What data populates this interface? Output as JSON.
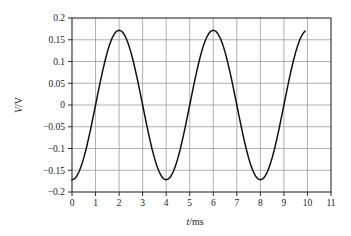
{
  "chart_data": {
    "type": "line",
    "title": "",
    "subtitle": "",
    "xlabel": "t/ms",
    "xlabel_variable": "t",
    "xlabel_unit": "/ms",
    "ylabel": "V/V",
    "ylabel_variable": "V",
    "ylabel_unit": "/V",
    "xlim": [
      0,
      11
    ],
    "ylim": [
      -0.2,
      0.2
    ],
    "xticks": [
      0,
      1,
      2,
      3,
      4,
      5,
      6,
      7,
      8,
      9,
      10,
      11
    ],
    "xtick_labels": [
      "0",
      "1",
      "2",
      "3",
      "4",
      "5",
      "6",
      "7",
      "8",
      "9",
      "10",
      "11"
    ],
    "yticks": [
      0.2,
      0.15,
      0.1,
      0.05,
      0,
      -0.05,
      -0.1,
      -0.15,
      -0.2
    ],
    "ytick_labels": [
      "0.2",
      "0.15",
      "0.1",
      "0.05",
      "0",
      "−0.05",
      "−0.1",
      "−0.15",
      "−0.2"
    ],
    "grid": true,
    "grid_x": true,
    "grid_y": true,
    "legend": false,
    "legend_position": "none",
    "waveform": {
      "shape": "sinusoid",
      "amplitude": 0.172,
      "period_ms": 4.0,
      "frequency_hz": 250,
      "offset": 0,
      "phase_description": "starts at minimum at t = 0",
      "data_start_ms": 0,
      "data_end_ms": 9.9
    },
    "annotations": [],
    "features": [
      {
        "label": "start",
        "t_ms": 0,
        "v": -0.172
      },
      {
        "label": "zero-crossing-rising",
        "t_ms": 1.0,
        "v": 0
      },
      {
        "label": "peak-1",
        "t_ms": 1.95,
        "v": 0.172
      },
      {
        "label": "zero-crossing-falling",
        "t_ms": 3.0,
        "v": 0
      },
      {
        "label": "trough-1",
        "t_ms": 4.0,
        "v": -0.172
      },
      {
        "label": "zero-crossing-rising",
        "t_ms": 5.0,
        "v": 0
      },
      {
        "label": "peak-2",
        "t_ms": 5.95,
        "v": 0.172
      },
      {
        "label": "zero-crossing-falling",
        "t_ms": 7.0,
        "v": 0
      },
      {
        "label": "trough-2",
        "t_ms": 8.0,
        "v": -0.172
      },
      {
        "label": "zero-crossing-rising",
        "t_ms": 9.0,
        "v": 0
      },
      {
        "label": "end",
        "t_ms": 9.9,
        "v": 0.171
      }
    ],
    "x": [
      0,
      0.1,
      0.2,
      0.3,
      0.4,
      0.5,
      0.6,
      0.7,
      0.8,
      0.9,
      1.0,
      1.1,
      1.2,
      1.3,
      1.4,
      1.5,
      1.6,
      1.7,
      1.8,
      1.9,
      2.0,
      2.1,
      2.2,
      2.3,
      2.4,
      2.5,
      2.6,
      2.7,
      2.8,
      2.9,
      3.0,
      3.1,
      3.2,
      3.3,
      3.4,
      3.5,
      3.6,
      3.7,
      3.8,
      3.9,
      4.0,
      4.1,
      4.2,
      4.3,
      4.4,
      4.5,
      4.6,
      4.7,
      4.8,
      4.9,
      5.0,
      5.1,
      5.2,
      5.3,
      5.4,
      5.5,
      5.6,
      5.7,
      5.8,
      5.9,
      6.0,
      6.1,
      6.2,
      6.3,
      6.4,
      6.5,
      6.6,
      6.7,
      6.8,
      6.9,
      7.0,
      7.1,
      7.2,
      7.3,
      7.4,
      7.5,
      7.6,
      7.7,
      7.8,
      7.9,
      8.0,
      8.1,
      8.2,
      8.3,
      8.4,
      8.5,
      8.6,
      8.7,
      8.8,
      8.9,
      9.0,
      9.1,
      9.2,
      9.3,
      9.4,
      9.5,
      9.6,
      9.7,
      9.8,
      9.9
    ],
    "y": [
      -0.172,
      -0.1699,
      -0.1637,
      -0.1535,
      -0.1393,
      -0.1216,
      -0.1011,
      -0.0779,
      -0.0531,
      -0.0269,
      0.0,
      0.0269,
      0.0531,
      0.0779,
      0.1011,
      0.1216,
      0.1393,
      0.1535,
      0.1637,
      0.1699,
      0.172,
      0.1699,
      0.1637,
      0.1535,
      0.1393,
      0.1216,
      0.1011,
      0.0779,
      0.0531,
      0.0269,
      0.0,
      -0.0269,
      -0.0531,
      -0.0779,
      -0.1011,
      -0.1216,
      -0.1393,
      -0.1535,
      -0.1637,
      -0.1699,
      -0.172,
      -0.1699,
      -0.1637,
      -0.1535,
      -0.1393,
      -0.1216,
      -0.1011,
      -0.0779,
      -0.0531,
      -0.0269,
      0.0,
      0.0269,
      0.0531,
      0.0779,
      0.1011,
      0.1216,
      0.1393,
      0.1535,
      0.1637,
      0.1699,
      0.172,
      0.1699,
      0.1637,
      0.1535,
      0.1393,
      0.1216,
      0.1011,
      0.0779,
      0.0531,
      0.0269,
      0.0,
      -0.0269,
      -0.0531,
      -0.0779,
      -0.1011,
      -0.1216,
      -0.1393,
      -0.1535,
      -0.1637,
      -0.1699,
      -0.172,
      -0.1699,
      -0.1637,
      -0.1535,
      -0.1393,
      -0.1216,
      -0.1011,
      -0.0779,
      -0.0531,
      -0.0269,
      0.0,
      0.0269,
      0.0531,
      0.0779,
      0.1011,
      0.1216,
      0.1393,
      0.1535,
      0.1637,
      0.1699
    ],
    "colors": {
      "curve": "#111111",
      "grid": "#9a9a9a",
      "frame": "#2b2b2b",
      "background": "#ffffff",
      "text": "#1a1a1a"
    }
  }
}
